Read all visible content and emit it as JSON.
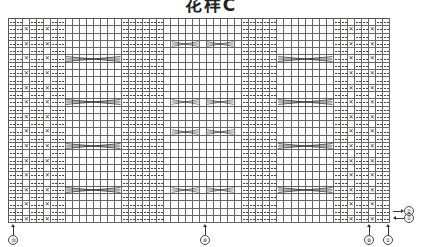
{
  "title": "花样C",
  "chart": {
    "columns": 54,
    "rows": 28,
    "cell_width": 7.07,
    "cell_height": 7.3,
    "column_types": [
      "p",
      "p",
      "x",
      "p",
      "p",
      "x",
      "p",
      "p",
      "k",
      "k",
      "k",
      "k",
      "k",
      "k",
      "k",
      "k",
      "p",
      "p",
      "p",
      "p",
      "p",
      "p",
      "k",
      "k",
      "k",
      "k",
      "k",
      "k",
      "k",
      "k",
      "k",
      "k",
      "k",
      "p",
      "p",
      "p",
      "p",
      "p",
      "k",
      "k",
      "k",
      "k",
      "k",
      "k",
      "k",
      "k",
      "p",
      "p",
      "x",
      "p",
      "p",
      "x",
      "p",
      "p"
    ],
    "x_rows": "even",
    "cables": [
      {
        "row": 6,
        "col_start": 9,
        "width": 8
      },
      {
        "row": 12,
        "col_start": 9,
        "width": 8
      },
      {
        "row": 18,
        "col_start": 9,
        "width": 8
      },
      {
        "row": 24,
        "col_start": 9,
        "width": 8
      },
      {
        "row": 4,
        "col_start": 24,
        "width": 4
      },
      {
        "row": 4,
        "col_start": 29,
        "width": 4
      },
      {
        "row": 12,
        "col_start": 24,
        "width": 4
      },
      {
        "row": 12,
        "col_start": 29,
        "width": 4
      },
      {
        "row": 16,
        "col_start": 24,
        "width": 4
      },
      {
        "row": 16,
        "col_start": 29,
        "width": 4
      },
      {
        "row": 24,
        "col_start": 24,
        "width": 4
      },
      {
        "row": 24,
        "col_start": 29,
        "width": 4
      },
      {
        "row": 6,
        "col_start": 39,
        "width": 8
      },
      {
        "row": 12,
        "col_start": 39,
        "width": 8
      },
      {
        "row": 18,
        "col_start": 39,
        "width": 8
      },
      {
        "row": 24,
        "col_start": 39,
        "width": 8
      }
    ],
    "legend": {
      "p": "purl (—)",
      "k": "knit (blank)",
      "x": "twisted stitch (✕)",
      "cable": "cable cross"
    }
  },
  "markers": {
    "bottom": [
      {
        "label": "⑳",
        "x": 13
      },
      {
        "label": "⑩",
        "x": 205
      },
      {
        "label": "⑩",
        "x": 369
      },
      {
        "label": "①",
        "x": 388
      }
    ],
    "right": [
      {
        "label": "②",
        "y": 210,
        "direction": "right"
      },
      {
        "label": "①",
        "y": 217,
        "direction": "left"
      }
    ]
  }
}
